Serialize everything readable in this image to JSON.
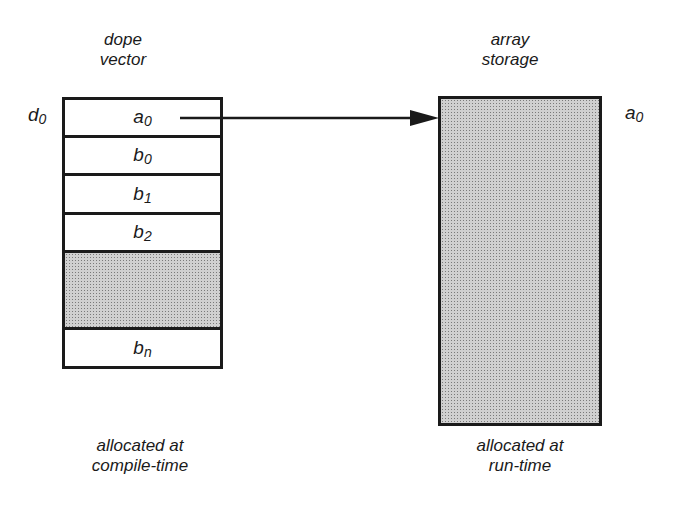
{
  "dope_vector": {
    "title_line1": "dope",
    "title_line2": "vector",
    "row_label": {
      "base": "d",
      "sub": "0"
    },
    "cells": [
      {
        "base": "a",
        "sub": "0",
        "shaded": false
      },
      {
        "base": "b",
        "sub": "0",
        "shaded": false
      },
      {
        "base": "b",
        "sub": "1",
        "shaded": false
      },
      {
        "base": "b",
        "sub": "2",
        "shaded": false
      },
      {
        "base": "",
        "sub": "",
        "shaded": true
      },
      {
        "base": "b",
        "sub": "n",
        "shaded": false
      }
    ],
    "caption_line1": "allocated at",
    "caption_line2": "compile-time"
  },
  "array_storage": {
    "title_line1": "array",
    "title_line2": "storage",
    "side_label": {
      "base": "a",
      "sub": "0"
    },
    "caption_line1": "allocated at",
    "caption_line2": "run-time"
  },
  "arrow": {
    "from": "a0 cell",
    "to": "array storage"
  }
}
